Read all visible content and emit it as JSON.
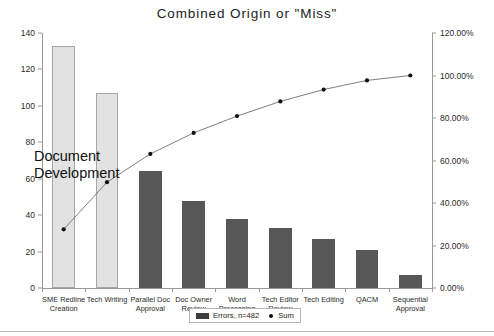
{
  "chart_data": {
    "type": "bar",
    "title": "Combined Origin or \"Miss\"",
    "xlabel": "",
    "ylabel": "",
    "categories": [
      "SME Redline Creation",
      "Tech Writing",
      "Parallel Doc Approval",
      "Doc Owner Review",
      "Word Processing",
      "Tech Editor Review",
      "Tech Editing",
      "QACM",
      "Sequential Approval"
    ],
    "series": [
      {
        "name": "Errors, n=482",
        "type": "bar",
        "axis": "left",
        "values": [
          133,
          107,
          64,
          48,
          38,
          33,
          27,
          21,
          7
        ]
      },
      {
        "name": "Sum",
        "type": "line",
        "axis": "right",
        "values": [
          0.276,
          0.498,
          0.631,
          0.73,
          0.809,
          0.878,
          0.934,
          0.977,
          1.0
        ]
      }
    ],
    "bar_colors": [
      "#e2e2e2",
      "#e2e2e2",
      "#575757",
      "#575757",
      "#575757",
      "#575757",
      "#575757",
      "#575757",
      "#575757"
    ],
    "ylim": [
      0,
      140
    ],
    "yticks": [
      "0",
      "20",
      "40",
      "60",
      "80",
      "100",
      "120",
      "140"
    ],
    "y2lim": [
      0,
      1.2
    ],
    "y2ticks": [
      "0.00%",
      "20.00%",
      "40.00%",
      "60.00%",
      "80.00%",
      "100.00%",
      "120.00%"
    ],
    "grid": false,
    "legend_position": "bottom",
    "annotations": [
      {
        "text_line1": "Document",
        "text_line2": "Development"
      }
    ]
  },
  "legend": {
    "bar_label": "Errors, n=482",
    "line_label": "Sum"
  },
  "colors": {
    "bar_dark": "#575757",
    "bar_light": "#e2e2e2",
    "line": "#6f6f6f",
    "marker": "#111111",
    "axis": "#9a9a9a"
  }
}
